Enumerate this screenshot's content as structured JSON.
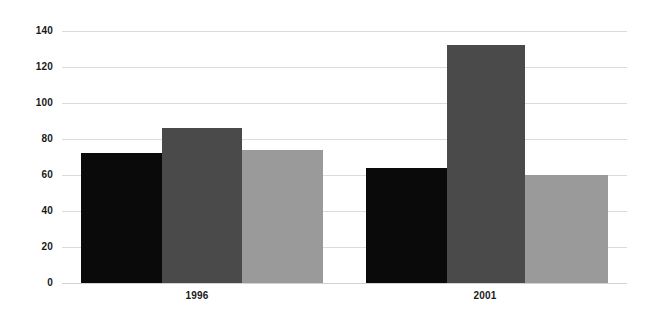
{
  "chart_data": {
    "type": "bar",
    "title": "",
    "subtitle": "",
    "xlabel": "",
    "ylabel": "",
    "categories": [
      "1996",
      "2001"
    ],
    "series": [
      {
        "name": "Series 1",
        "color": "#0a0a0a",
        "values": [
          72,
          64
        ]
      },
      {
        "name": "Series 2",
        "color": "#4a4a4a",
        "values": [
          86,
          132
        ]
      },
      {
        "name": "Series 3",
        "color": "#9a9a9a",
        "values": [
          74,
          60
        ]
      }
    ],
    "ylim": [
      0,
      140
    ],
    "yticks": [
      0,
      20,
      40,
      60,
      80,
      100,
      120,
      140
    ],
    "ytick_labels": [
      "0",
      "20",
      "40",
      "60",
      "80",
      "100",
      "120",
      "140"
    ],
    "grid": true,
    "grid_color": "#dcdcdc",
    "legend": "none",
    "annotations": []
  },
  "axis": {
    "y": {
      "t0": "0",
      "t1": "20",
      "t2": "40",
      "t3": "60",
      "t4": "80",
      "t5": "100",
      "t6": "120",
      "t7": "140"
    },
    "x": {
      "c0": "1996",
      "c1": "2001"
    }
  },
  "colors": {
    "series1": "#0a0a0a",
    "series2": "#4a4a4a",
    "series3": "#9a9a9a",
    "grid": "#dcdcdc",
    "background": "#ffffff",
    "text": "#1a1a1a"
  }
}
